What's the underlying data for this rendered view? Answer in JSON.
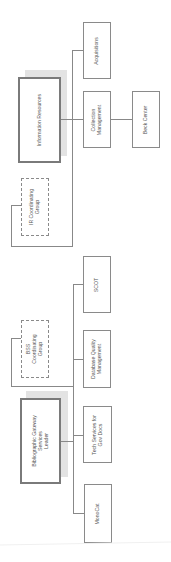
{
  "diagram": {
    "type": "org-chart",
    "orientation": "rotated-90",
    "nodes": [
      {
        "id": "ir",
        "label": "Information Resources",
        "style": "primary"
      },
      {
        "id": "acq",
        "label": "Acquisitions",
        "style": "normal"
      },
      {
        "id": "cm",
        "label": "Collection Management",
        "line1": "Collection",
        "line2": "Management",
        "style": "normal"
      },
      {
        "id": "beck",
        "label": "Beck Center",
        "style": "normal"
      },
      {
        "id": "irg",
        "label": "IR Coordinating Group",
        "line1": "IR Coordinating",
        "line2": "Group",
        "style": "dashed"
      },
      {
        "id": "scot",
        "label": "SCOT",
        "style": "normal"
      },
      {
        "id": "dqm",
        "label": "Database Quality Management",
        "line1": "Database Quality",
        "line2": "Management",
        "style": "normal"
      },
      {
        "id": "bss",
        "label": "BSS Coordinating Group",
        "line1": "BSS",
        "line2": "Coordinating",
        "line3": "Group",
        "style": "dashed"
      },
      {
        "id": "bgs",
        "label": "Bibliographic Gateway Services Leader",
        "line1": "Bibliographic Gateway",
        "line2": "Services",
        "line3": "Leader",
        "style": "primary"
      },
      {
        "id": "tsgd",
        "label": "Tech Services for Gov Docs",
        "line1": "Tech Services for",
        "line2": "Gov Docs",
        "style": "normal"
      },
      {
        "id": "mono",
        "label": "MonoCat",
        "style": "normal"
      }
    ],
    "edges": [
      [
        "ir",
        "acq"
      ],
      [
        "ir",
        "cm"
      ],
      [
        "cm",
        "beck"
      ],
      [
        "ir",
        "irg"
      ],
      [
        "bgs",
        "scot"
      ],
      [
        "bgs",
        "dqm"
      ],
      [
        "bgs",
        "tsgd"
      ],
      [
        "bgs",
        "mono"
      ],
      [
        "bgs",
        "bss"
      ]
    ]
  }
}
